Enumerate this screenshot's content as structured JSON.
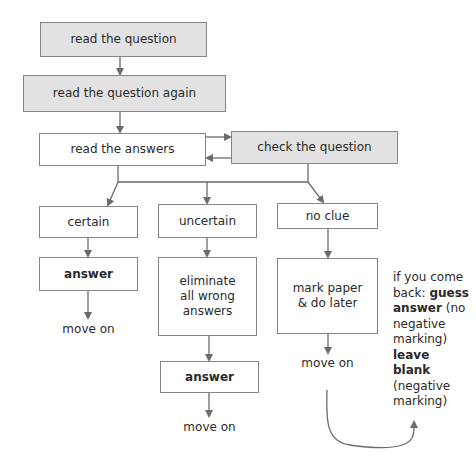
{
  "flowchart": {
    "steps": {
      "read_question": "read the question",
      "read_question_again": "read the question again",
      "read_answers": "read the answers",
      "check_question": "check the question"
    },
    "branches": {
      "certain": {
        "label": "certain",
        "action": "answer",
        "next": "move on"
      },
      "uncertain": {
        "label": "uncertain",
        "action": "eliminate all wrong answers",
        "action2": "answer",
        "next": "move on"
      },
      "no_clue": {
        "label": "no clue",
        "action": "mark paper & do later",
        "next": "move on"
      }
    },
    "note": {
      "line1": "if you come back:",
      "guess": "guess answer",
      "guess_detail": "(no negative marking)",
      "leave": "leave blank",
      "leave_detail": "(negative marking)"
    }
  },
  "colors": {
    "grey_box": "#e2e2e2",
    "border": "#858585",
    "arrow": "#6b6b6b"
  }
}
